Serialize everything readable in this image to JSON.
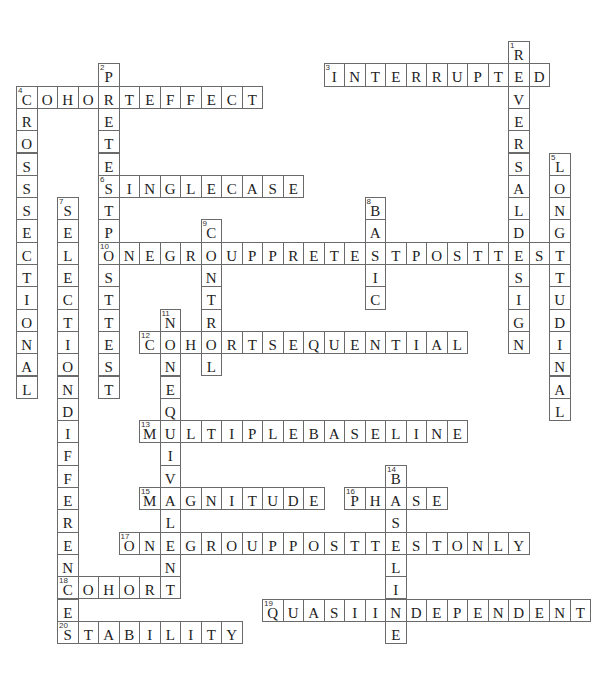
{
  "puzzle": {
    "grid": {
      "origin_x": 16,
      "origin_y": 41,
      "cell_w": 20.5,
      "cell_h": 22.3
    },
    "across": [
      {
        "number": 3,
        "answer": "INTERRUPTED",
        "row": 1,
        "col": 15
      },
      {
        "number": 4,
        "answer": "COHORTEFFECT",
        "row": 2,
        "col": 0
      },
      {
        "number": 6,
        "answer": "SINGLECASE",
        "row": 6,
        "col": 4
      },
      {
        "number": 10,
        "answer": "ONEGROUPPRETESTPOSTTEST",
        "row": 9,
        "col": 4
      },
      {
        "number": 12,
        "answer": "COHORTSEQUENTIAL",
        "row": 13,
        "col": 6
      },
      {
        "number": 13,
        "answer": "MULTIPLEBASELINE",
        "row": 17,
        "col": 6
      },
      {
        "number": 15,
        "answer": "MAGNITUDE",
        "row": 20,
        "col": 6
      },
      {
        "number": 16,
        "answer": "PHASE",
        "row": 20,
        "col": 16
      },
      {
        "number": 17,
        "answer": "ONEGROUPPOSTTESTONLY",
        "row": 22,
        "col": 5
      },
      {
        "number": 18,
        "answer": "COHORT",
        "row": 24,
        "col": 2
      },
      {
        "number": 19,
        "answer": "QUASIINDEPENDENT",
        "row": 25,
        "col": 12
      },
      {
        "number": 20,
        "answer": "STABILITY",
        "row": 26,
        "col": 2
      }
    ],
    "down": [
      {
        "number": 1,
        "answer": "REVERSALDESIGN",
        "row": 0,
        "col": 24
      },
      {
        "number": 2,
        "answer": "PRETESTPOSTTEST",
        "row": 1,
        "col": 4
      },
      {
        "number": 4,
        "answer": "CROSSSECTIONAL",
        "row": 2,
        "col": 0
      },
      {
        "number": 5,
        "answer": "LONGITUDINAL",
        "row": 5,
        "col": 26
      },
      {
        "number": 7,
        "answer": "SELECTIONDIFFERENCES",
        "row": 7,
        "col": 2
      },
      {
        "number": 8,
        "answer": "BASIC",
        "row": 7,
        "col": 17
      },
      {
        "number": 9,
        "answer": "CONTROL",
        "row": 8,
        "col": 9
      },
      {
        "number": 11,
        "answer": "NONEQUIVALENT",
        "row": 12,
        "col": 7
      },
      {
        "number": 14,
        "answer": "BASELINE",
        "row": 19,
        "col": 18
      }
    ]
  }
}
